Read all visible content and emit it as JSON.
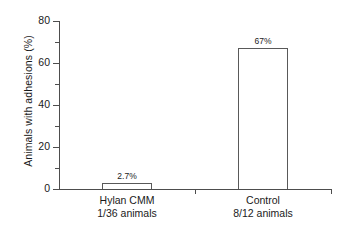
{
  "chart_data": {
    "type": "bar",
    "title": "",
    "subtitle": "",
    "xlabel": "",
    "ylabel": "Animals with adhesions (%)",
    "categories": [
      "Hylan CMM",
      "Control"
    ],
    "category_sublabels": [
      "1/36 animals",
      "8/12 animals"
    ],
    "values": [
      2.7,
      67
    ],
    "value_labels": [
      "2.7%",
      "67%"
    ],
    "ylim": [
      0,
      80
    ],
    "yticks": [
      0,
      20,
      40,
      60,
      80
    ],
    "ytick_labels": [
      "0",
      "20",
      "40",
      "60",
      "80"
    ],
    "yticks_minor": [
      10,
      30,
      50,
      70
    ],
    "grid": false,
    "legend": false,
    "legend_position": "none",
    "bar_fill_color": "#ffffff",
    "bar_edge_color": "#595959",
    "axis_color": "#4d4d4d",
    "text_color": "#1a1a1a",
    "background_color": "#ffffff"
  }
}
